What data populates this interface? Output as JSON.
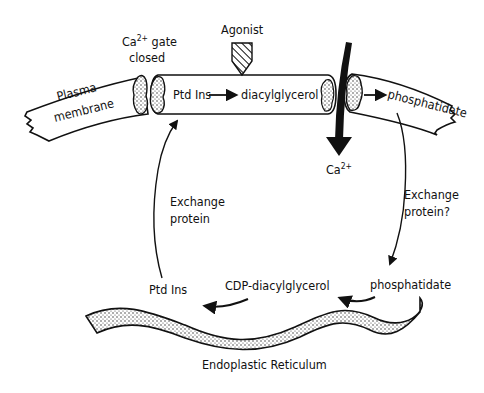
{
  "diagram": {
    "title": "",
    "colors": {
      "ink": "#111111",
      "background": "#ffffff",
      "stipple": "#bdbdbd"
    },
    "labels": {
      "agonist": "Agonist",
      "ca_gate_line1_base": "Ca",
      "ca_gate_line1_sup": "2+",
      "ca_gate_line1_rest": " gate",
      "ca_gate_line2": "closed",
      "plasma_line1": "Plasma",
      "plasma_line2": "membrane",
      "ptd_ins_membrane": "Ptd Ins",
      "diacylglycerol": "diacylglycerol",
      "phosphatidate_membrane": "phosphatidate",
      "ca_influx_base": "Ca",
      "ca_influx_sup": "2+",
      "exchange_left_line1": "Exchange",
      "exchange_left_line2": "protein",
      "exchange_right_line1": "Exchange",
      "exchange_right_line2": "protein?",
      "ptd_ins_er": "Ptd Ins",
      "cdp_diacylglycerol": "CDP-diacylglycerol",
      "phosphatidate_er": "phosphatidate",
      "er_label": "Endoplastic Reticulum"
    },
    "nodes": [
      {
        "id": "plasma-membrane-left",
        "type": "membrane-segment"
      },
      {
        "id": "ca-gate-closed",
        "type": "gate"
      },
      {
        "id": "ptd-ins-membrane",
        "type": "lipid"
      },
      {
        "id": "diacylglycerol",
        "type": "lipid"
      },
      {
        "id": "phosphatidate-membrane",
        "type": "lipid"
      },
      {
        "id": "ptd-ins-er",
        "type": "lipid"
      },
      {
        "id": "cdp-diacylglycerol",
        "type": "lipid"
      },
      {
        "id": "phosphatidate-er",
        "type": "lipid"
      },
      {
        "id": "endoplastic-reticulum",
        "type": "organelle"
      }
    ],
    "edges": [
      {
        "from": "ptd-ins-membrane",
        "to": "diacylglycerol",
        "note": "agonist-stimulated"
      },
      {
        "from": "diacylglycerol",
        "to": "phosphatidate-membrane"
      },
      {
        "from": "phosphatidate-membrane",
        "to": "phosphatidate-er",
        "via": "Exchange protein?"
      },
      {
        "from": "phosphatidate-er",
        "to": "cdp-diacylglycerol"
      },
      {
        "from": "cdp-diacylglycerol",
        "to": "ptd-ins-er"
      },
      {
        "from": "ptd-ins-er",
        "to": "ptd-ins-membrane",
        "via": "Exchange protein"
      },
      {
        "from": "extracellular",
        "to": "cytosol",
        "species": "Ca2+",
        "note": "influx through open gate"
      }
    ]
  }
}
